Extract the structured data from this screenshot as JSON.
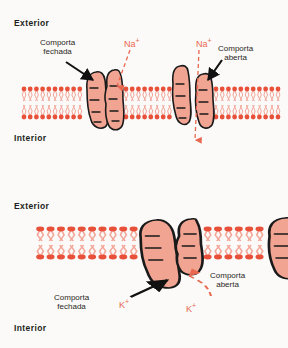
{
  "figure": {
    "background_color": "#fbfaf8"
  },
  "colors": {
    "lipid_head": "#e8503a",
    "lipid_tail": "#f3a79a",
    "protein_fill": "#f2a493",
    "protein_outline": "#1a1a1a",
    "ion_text": "#e8674f",
    "ion_arrow": "#e8674f",
    "pointer_arrow": "#111111",
    "label_text": "#231f20"
  },
  "panels": [
    {
      "id": "sodium",
      "exterior_label": "Exterior",
      "interior_label": "Interior",
      "ion": "Na",
      "ion_charge": "+",
      "ion_labels": [
        {
          "name": "na-label-left",
          "text": "Na",
          "charge": "+"
        },
        {
          "name": "na-label-right",
          "text": "Na",
          "charge": "+"
        }
      ],
      "gates": [
        {
          "name": "closed-gate",
          "label_line1": "Comporta",
          "label_line2": "fechada",
          "state": "closed"
        },
        {
          "name": "open-gate",
          "label_line1": "Comporta",
          "label_line2": "aberta",
          "state": "open"
        }
      ],
      "flow_direction": "inward"
    },
    {
      "id": "potassium",
      "exterior_label": "Exterior",
      "interior_label": "Interior",
      "ion": "K",
      "ion_charge": "+",
      "ion_labels": [
        {
          "name": "k-label-left",
          "text": "K",
          "charge": "+"
        },
        {
          "name": "k-label-right",
          "text": "K",
          "charge": "+"
        }
      ],
      "gates": [
        {
          "name": "closed-gate",
          "label_line1": "Comporta",
          "label_line2": "fechada",
          "state": "closed"
        },
        {
          "name": "open-gate",
          "label_line1": "Comporta",
          "label_line2": "aberta",
          "state": "open"
        }
      ],
      "flow_direction": "outward"
    }
  ]
}
